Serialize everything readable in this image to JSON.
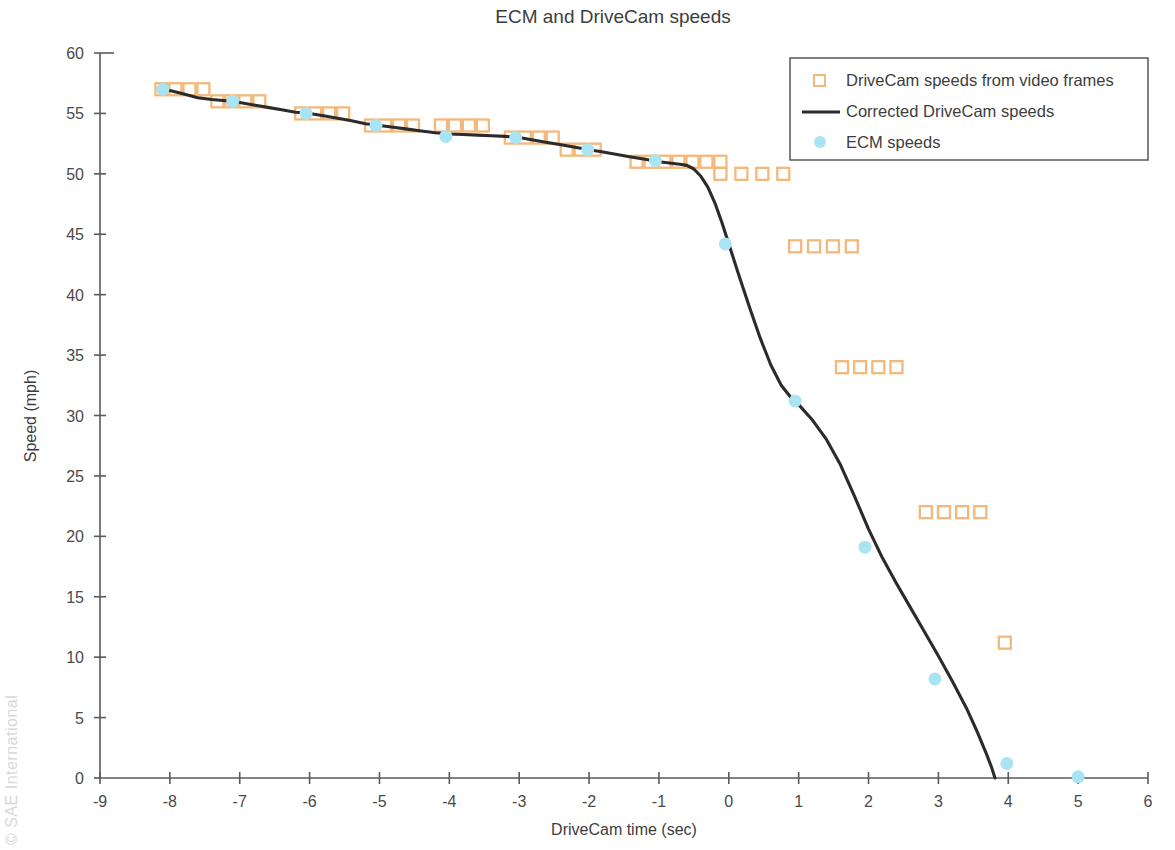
{
  "chart_data": {
    "type": "scatter",
    "title": "ECM and DriveCam speeds",
    "xlabel": "DriveCam time (sec)",
    "ylabel": "Speed (mph)",
    "xlim": [
      -9,
      6
    ],
    "ylim": [
      0,
      60
    ],
    "xticks": [
      -9,
      -8,
      -7,
      -6,
      -5,
      -4,
      -3,
      -2,
      -1,
      0,
      1,
      2,
      3,
      4,
      5,
      6
    ],
    "yticks": [
      0,
      5,
      10,
      15,
      20,
      25,
      30,
      35,
      40,
      45,
      50,
      55,
      60
    ],
    "xtick_labels": [
      "-9",
      "-8",
      "-7",
      "-6",
      "-5",
      "-4",
      "-3",
      "-2",
      "-1",
      "0",
      "1",
      "2",
      "3",
      "4",
      "5",
      "6"
    ],
    "ytick_labels": [
      "0",
      "5",
      "10",
      "15",
      "20",
      "25",
      "30",
      "35",
      "40",
      "45",
      "50",
      "55",
      "60"
    ],
    "grid": false,
    "legend_position": "top-right",
    "colors": {
      "drivecam_marker": "#F3B87B",
      "corrected_line": "#2b2b2b",
      "ecm_marker": "#A9E4F2"
    },
    "series": [
      {
        "name": "DriveCam speeds from video frames",
        "marker": "open-square",
        "color": "#F3B87B",
        "points": [
          [
            -8.12,
            57
          ],
          [
            -7.92,
            57
          ],
          [
            -7.72,
            57
          ],
          [
            -7.52,
            57
          ],
          [
            -7.32,
            56
          ],
          [
            -7.12,
            56
          ],
          [
            -6.92,
            56
          ],
          [
            -6.72,
            56
          ],
          [
            -6.12,
            55
          ],
          [
            -5.92,
            55
          ],
          [
            -5.72,
            55
          ],
          [
            -5.52,
            55
          ],
          [
            -5.12,
            54
          ],
          [
            -4.92,
            54
          ],
          [
            -4.72,
            54
          ],
          [
            -4.52,
            54
          ],
          [
            -4.12,
            54
          ],
          [
            -3.92,
            54
          ],
          [
            -3.72,
            54
          ],
          [
            -3.52,
            54
          ],
          [
            -3.12,
            53
          ],
          [
            -2.92,
            53
          ],
          [
            -2.72,
            53
          ],
          [
            -2.52,
            53
          ],
          [
            -2.32,
            52
          ],
          [
            -2.12,
            52
          ],
          [
            -1.92,
            52
          ],
          [
            -1.32,
            51
          ],
          [
            -1.12,
            51
          ],
          [
            -0.92,
            51
          ],
          [
            -0.72,
            51
          ],
          [
            -0.52,
            51
          ],
          [
            -0.32,
            51
          ],
          [
            -0.12,
            51
          ],
          [
            -0.12,
            50
          ],
          [
            0.18,
            50
          ],
          [
            0.48,
            50
          ],
          [
            0.78,
            50
          ],
          [
            0.95,
            44
          ],
          [
            1.22,
            44
          ],
          [
            1.49,
            44
          ],
          [
            1.76,
            44
          ],
          [
            1.62,
            34
          ],
          [
            1.88,
            34
          ],
          [
            2.14,
            34
          ],
          [
            2.4,
            34
          ],
          [
            2.82,
            22
          ],
          [
            3.08,
            22
          ],
          [
            3.34,
            22
          ],
          [
            3.6,
            22
          ],
          [
            3.95,
            11.2
          ]
        ]
      },
      {
        "name": "Corrected DriveCam speeds",
        "marker": "line",
        "color": "#2b2b2b",
        "points": [
          [
            -8.15,
            57.0
          ],
          [
            -8.0,
            56.9
          ],
          [
            -7.8,
            56.6
          ],
          [
            -7.6,
            56.3
          ],
          [
            -7.4,
            56.15
          ],
          [
            -7.2,
            56.05
          ],
          [
            -7.0,
            55.9
          ],
          [
            -6.8,
            55.7
          ],
          [
            -6.6,
            55.5
          ],
          [
            -6.4,
            55.3
          ],
          [
            -6.2,
            55.1
          ],
          [
            -6.0,
            55.0
          ],
          [
            -5.8,
            54.8
          ],
          [
            -5.6,
            54.6
          ],
          [
            -5.4,
            54.4
          ],
          [
            -5.2,
            54.15
          ],
          [
            -5.0,
            54.0
          ],
          [
            -4.8,
            53.85
          ],
          [
            -4.6,
            53.7
          ],
          [
            -4.4,
            53.55
          ],
          [
            -4.2,
            53.4
          ],
          [
            -4.0,
            53.3
          ],
          [
            -3.8,
            53.25
          ],
          [
            -3.6,
            53.2
          ],
          [
            -3.4,
            53.15
          ],
          [
            -3.2,
            53.1
          ],
          [
            -3.0,
            53.0
          ],
          [
            -2.8,
            52.8
          ],
          [
            -2.6,
            52.6
          ],
          [
            -2.4,
            52.4
          ],
          [
            -2.2,
            52.2
          ],
          [
            -2.0,
            52.0
          ],
          [
            -1.8,
            51.8
          ],
          [
            -1.6,
            51.6
          ],
          [
            -1.4,
            51.4
          ],
          [
            -1.2,
            51.2
          ],
          [
            -1.0,
            51.0
          ],
          [
            -0.85,
            50.9
          ],
          [
            -0.7,
            50.8
          ],
          [
            -0.6,
            50.7
          ],
          [
            -0.5,
            50.4
          ],
          [
            -0.4,
            49.8
          ],
          [
            -0.3,
            48.9
          ],
          [
            -0.2,
            47.6
          ],
          [
            -0.1,
            46.0
          ],
          [
            0.0,
            44.2
          ],
          [
            0.15,
            41.5
          ],
          [
            0.3,
            38.9
          ],
          [
            0.45,
            36.4
          ],
          [
            0.6,
            34.2
          ],
          [
            0.75,
            32.5
          ],
          [
            0.9,
            31.4
          ],
          [
            1.0,
            30.9
          ],
          [
            1.2,
            29.6
          ],
          [
            1.4,
            28.0
          ],
          [
            1.6,
            25.9
          ],
          [
            1.8,
            23.3
          ],
          [
            2.0,
            20.6
          ],
          [
            2.2,
            18.2
          ],
          [
            2.4,
            16.1
          ],
          [
            2.6,
            14.1
          ],
          [
            2.8,
            12.1
          ],
          [
            3.0,
            10.1
          ],
          [
            3.2,
            8.0
          ],
          [
            3.4,
            5.8
          ],
          [
            3.55,
            3.9
          ],
          [
            3.68,
            2.1
          ],
          [
            3.76,
            0.9
          ],
          [
            3.81,
            0.0
          ]
        ]
      },
      {
        "name": "ECM speeds",
        "marker": "filled-circle",
        "color": "#A9E4F2",
        "points": [
          [
            -8.1,
            57.0
          ],
          [
            -7.1,
            56.0
          ],
          [
            -6.05,
            55.0
          ],
          [
            -5.05,
            54.0
          ],
          [
            -4.05,
            53.1
          ],
          [
            -3.05,
            53.0
          ],
          [
            -2.02,
            52.0
          ],
          [
            -1.05,
            51.1
          ],
          [
            -0.05,
            44.2
          ],
          [
            0.95,
            31.2
          ],
          [
            1.95,
            19.1
          ],
          [
            2.95,
            8.2
          ],
          [
            3.98,
            1.2
          ],
          [
            5.0,
            0.1
          ]
        ]
      }
    ]
  },
  "legend": {
    "items": [
      {
        "label": "DriveCam speeds from video frames",
        "marker": "open-square"
      },
      {
        "label": "Corrected DriveCam speeds",
        "marker": "line"
      },
      {
        "label": "ECM speeds",
        "marker": "filled-circle"
      }
    ]
  },
  "watermark": {
    "text": "© SAE International"
  }
}
